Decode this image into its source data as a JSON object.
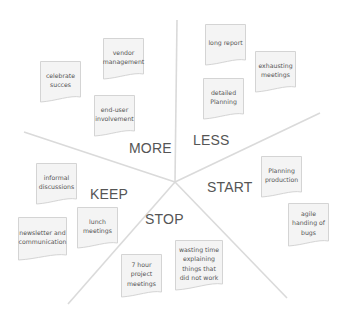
{
  "board": {
    "background": "#ffffff",
    "line_color": "#dadada",
    "note_fill": "#f4f4f4",
    "note_border": "#d4d4d4",
    "text_color": "#555555",
    "center": [
      175,
      182
    ],
    "dividers": [
      {
        "name": "divider-top",
        "to": [
          177,
          20
        ]
      },
      {
        "name": "divider-left",
        "to": [
          24,
          132
        ]
      },
      {
        "name": "divider-right",
        "to": [
          320,
          113
        ]
      },
      {
        "name": "divider-bottom-left",
        "to": [
          68,
          304
        ]
      },
      {
        "name": "divider-bottom-right",
        "to": [
          287,
          298
        ]
      }
    ]
  },
  "sections": {
    "more": {
      "label": "MORE"
    },
    "less": {
      "label": "LESS"
    },
    "start": {
      "label": "START"
    },
    "stop": {
      "label": "STOP"
    },
    "keep": {
      "label": "KEEP"
    }
  },
  "notes": {
    "more": [
      {
        "text": "celebrate succes"
      },
      {
        "text": "vendor management"
      },
      {
        "text": "end-user involvement"
      }
    ],
    "less": [
      {
        "text": "long report"
      },
      {
        "text": "exhausting meetings"
      },
      {
        "text": "detailed Planning"
      }
    ],
    "start": [
      {
        "text": "Planning production"
      },
      {
        "text": "agile handing of bugs"
      }
    ],
    "stop": [
      {
        "text": "7 hour project meetings"
      },
      {
        "text": "wasting time explaining things that did not work"
      }
    ],
    "keep": [
      {
        "text": "informal discussions"
      },
      {
        "text": "lunch meetings"
      },
      {
        "text": "newsletter and communication"
      }
    ]
  }
}
